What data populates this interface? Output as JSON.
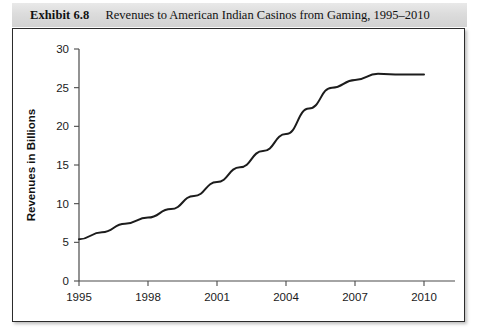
{
  "exhibit": {
    "label": "Exhibit 6.8",
    "caption": "Revenues to American Indian Casinos from Gaming, 1995–2010"
  },
  "chart_data": {
    "type": "line",
    "title": "Revenues to American Indian Casinos from Gaming, 1995–2010",
    "xlabel": "",
    "ylabel": "Revenues in Billions",
    "xlim": [
      1995,
      2011
    ],
    "ylim": [
      0,
      30
    ],
    "xticks": [
      1995,
      1998,
      2001,
      2004,
      2007,
      2010
    ],
    "xtick_labels": [
      "1995",
      "1998",
      "2001",
      "2004",
      "2007",
      "2010"
    ],
    "yticks": [
      0,
      5,
      10,
      15,
      20,
      25,
      30
    ],
    "ytick_labels": [
      "0",
      "5",
      "10",
      "15",
      "20",
      "25",
      "30"
    ],
    "grid": false,
    "legend": false,
    "x": [
      1995,
      1996,
      1997,
      1998,
      1999,
      2000,
      2001,
      2002,
      2003,
      2004,
      2005,
      2006,
      2007,
      2008,
      2009,
      2010
    ],
    "values": [
      5.4,
      6.3,
      7.4,
      8.2,
      9.3,
      11.0,
      12.8,
      14.7,
      16.8,
      19.0,
      22.3,
      25.0,
      26.0,
      26.8,
      26.7,
      26.7
    ],
    "series": [
      {
        "name": "Revenues in Billions",
        "color": "#1c1c1c",
        "values": [
          5.4,
          6.3,
          7.4,
          8.2,
          9.3,
          11.0,
          12.8,
          14.7,
          16.8,
          19.0,
          22.3,
          25.0,
          26.0,
          26.8,
          26.7,
          26.7
        ]
      }
    ]
  },
  "colors": {
    "line": "#1c1c1c",
    "axis": "#4a4a4a",
    "caption_band": "#dcdcdc",
    "frame_border": "#2b2b2b"
  }
}
